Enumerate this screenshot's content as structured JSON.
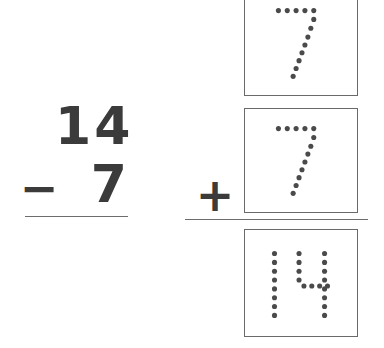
{
  "page": {
    "kind": "math-worksheet",
    "background_color": "#ffffff",
    "ink_color": "#3b3b3b",
    "box_border_color": "#6a6a6a",
    "rule_color": "#6d6d6d",
    "dot_color": "#4a4a4a"
  },
  "printed_problem": {
    "name": "vertical-subtraction",
    "minuend": "14",
    "operator": "−",
    "subtrahend": "7",
    "answer": "",
    "rule_visible": true
  },
  "trace_problem": {
    "name": "vertical-addition-tracing",
    "operator": "+",
    "rule_visible": true,
    "boxes": [
      {
        "position": "top",
        "value": "7",
        "style": "dotted-trace",
        "clipped_at_top": true
      },
      {
        "position": "middle",
        "value": "7",
        "style": "dotted-trace",
        "clipped_at_top": false
      },
      {
        "position": "bottom",
        "value": "14",
        "style": "dotted-trace",
        "clipped_at_top": false
      }
    ]
  }
}
